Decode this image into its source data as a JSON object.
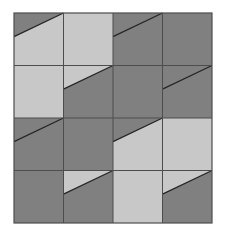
{
  "figure": {
    "background_color": "#ffffff"
  },
  "palette": {
    "dark": "#808080",
    "light": "#c8c8c8",
    "line": "#262626",
    "grid_line": "#4d4d4d",
    "border": "#4d4d4d"
  },
  "grid": {
    "rows": 4,
    "cols": 4,
    "origin_x": 14,
    "origin_y": 13,
    "cell_width": 49.5,
    "cell_height": 52.5,
    "total_width": 198,
    "total_height": 210,
    "diagonal_start_frac": 0.45,
    "show_grid_lines": true,
    "show_border": true
  },
  "chart_data": {
    "type": "heatmap",
    "xlabel": "",
    "ylabel": "",
    "categories": [
      "c1",
      "c2",
      "c3",
      "c4"
    ],
    "rows": [
      "r1",
      "r2",
      "r3",
      "r4"
    ],
    "legend": [
      {
        "name": "dark",
        "color": "#808080"
      },
      {
        "name": "light",
        "color": "#c8c8c8"
      }
    ],
    "cells": [
      {
        "row": 0,
        "col": 0,
        "upper": "dark",
        "lower": "light",
        "diagonal": true
      },
      {
        "row": 0,
        "col": 1,
        "upper": "light",
        "lower": "light",
        "diagonal": false
      },
      {
        "row": 0,
        "col": 2,
        "upper": "dark",
        "lower": "dark",
        "diagonal": true
      },
      {
        "row": 0,
        "col": 3,
        "upper": "dark",
        "lower": "dark",
        "diagonal": false
      },
      {
        "row": 1,
        "col": 0,
        "upper": "light",
        "lower": "light",
        "diagonal": false
      },
      {
        "row": 1,
        "col": 1,
        "upper": "light",
        "lower": "dark",
        "diagonal": true
      },
      {
        "row": 1,
        "col": 2,
        "upper": "dark",
        "lower": "dark",
        "diagonal": false
      },
      {
        "row": 1,
        "col": 3,
        "upper": "dark",
        "lower": "dark",
        "diagonal": true
      },
      {
        "row": 2,
        "col": 0,
        "upper": "dark",
        "lower": "dark",
        "diagonal": true
      },
      {
        "row": 2,
        "col": 1,
        "upper": "dark",
        "lower": "dark",
        "diagonal": false
      },
      {
        "row": 2,
        "col": 2,
        "upper": "dark",
        "lower": "light",
        "diagonal": true
      },
      {
        "row": 2,
        "col": 3,
        "upper": "light",
        "lower": "light",
        "diagonal": false
      },
      {
        "row": 3,
        "col": 0,
        "upper": "dark",
        "lower": "dark",
        "diagonal": false
      },
      {
        "row": 3,
        "col": 1,
        "upper": "light",
        "lower": "dark",
        "diagonal": true
      },
      {
        "row": 3,
        "col": 2,
        "upper": "light",
        "lower": "light",
        "diagonal": false
      },
      {
        "row": 3,
        "col": 3,
        "upper": "light",
        "lower": "dark",
        "diagonal": true
      }
    ]
  }
}
